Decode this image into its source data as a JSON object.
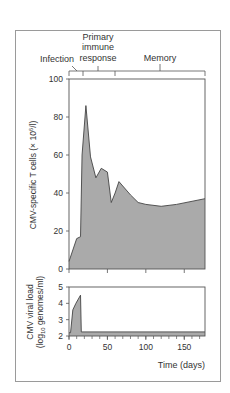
{
  "chart_data": [
    {
      "type": "area",
      "title": "",
      "phases": [
        "Infection",
        "Primary immune response",
        "Memory"
      ],
      "ylabel": "CMV-specific T cells (× 10⁶/l)",
      "xlabel": "",
      "ylim": [
        0,
        100
      ],
      "yticks": [
        0,
        20,
        40,
        60,
        80,
        100
      ],
      "xlim": [
        0,
        177
      ],
      "x": [
        0,
        10,
        15,
        17,
        22,
        28,
        35,
        42,
        50,
        55,
        60,
        65,
        80,
        90,
        100,
        120,
        140,
        177
      ],
      "values": [
        4,
        16,
        17,
        60,
        86,
        59,
        48,
        53,
        51,
        35,
        40,
        46,
        39,
        35,
        34,
        33,
        34,
        37
      ],
      "fill": "#aaaaaa"
    },
    {
      "type": "area",
      "title": "",
      "ylabel": "CMV viral load (log10 genomes/ml)",
      "xlabel": "Time (days)",
      "ylim": [
        2,
        5
      ],
      "yticks": [
        2,
        3,
        4,
        5
      ],
      "xticks": [
        0,
        50,
        100,
        150
      ],
      "xlim": [
        0,
        177
      ],
      "x": [
        0,
        2,
        5,
        9,
        15,
        16,
        17,
        177
      ],
      "values": [
        2.2,
        2.2,
        3.6,
        4.0,
        4.5,
        2.25,
        2.25,
        2.25
      ],
      "fill": "#aaaaaa"
    }
  ],
  "labels": {
    "infection": "Infection",
    "primary_1": "Primary",
    "primary_2": "immune",
    "primary_3": "response",
    "memory": "Memory",
    "top_ylabel": "CMV-specific T cells (× 10",
    "top_ylabel_sup": "6",
    "top_ylabel_end": "/l)",
    "bottom_ylabel_1": "CMV viral load",
    "bottom_ylabel_2a": "(log",
    "bottom_ylabel_2sub": "10",
    "bottom_ylabel_2b": " genomes/ml)",
    "xlabel": "Time (days)",
    "ytick_top": [
      "0",
      "20",
      "40",
      "60",
      "80",
      "100"
    ],
    "ytick_bottom": [
      "2",
      "3",
      "4",
      "5"
    ],
    "xtick": [
      "0",
      "50",
      "100",
      "150"
    ]
  }
}
